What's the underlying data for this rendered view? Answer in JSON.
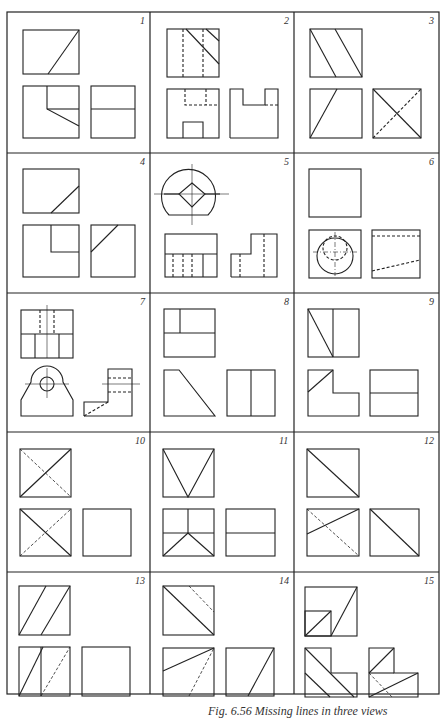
{
  "figure": {
    "caption": "Fig. 6.56  Missing lines in three views",
    "grid": {
      "columns": 3,
      "rows": 5
    },
    "line_color": "#222222",
    "cells": [
      {
        "number": "1"
      },
      {
        "number": "2"
      },
      {
        "number": "3"
      },
      {
        "number": "4"
      },
      {
        "number": "5"
      },
      {
        "number": "6"
      },
      {
        "number": "7"
      },
      {
        "number": "8"
      },
      {
        "number": "9"
      },
      {
        "number": "10"
      },
      {
        "number": "11"
      },
      {
        "number": "12"
      },
      {
        "number": "13"
      },
      {
        "number": "14"
      },
      {
        "number": "15"
      }
    ]
  }
}
